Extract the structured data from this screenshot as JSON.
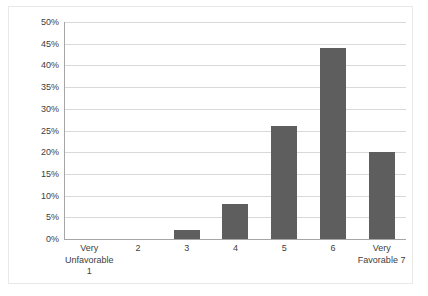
{
  "chart_data": {
    "type": "bar",
    "title": "",
    "xlabel": "",
    "ylabel": "",
    "categories": [
      "Very Unfavorable 1",
      "2",
      "3",
      "4",
      "5",
      "6",
      "Very Favorable 7"
    ],
    "category_label_lines": [
      [
        "Very",
        "Unfavorable",
        "1"
      ],
      [
        "2"
      ],
      [
        "3"
      ],
      [
        "4"
      ],
      [
        "5"
      ],
      [
        "6"
      ],
      [
        "Very",
        "Favorable 7"
      ]
    ],
    "values": [
      0,
      0,
      2,
      8,
      26,
      44,
      20
    ],
    "value_labels": [
      "0%",
      "0%",
      "2%",
      "8%",
      "26%",
      "44%",
      "20%"
    ],
    "ylim": [
      0,
      50
    ],
    "ytick_values": [
      0,
      5,
      10,
      15,
      20,
      25,
      30,
      35,
      40,
      45,
      50
    ],
    "ytick_labels": [
      "0%",
      "5%",
      "10%",
      "15%",
      "20%",
      "25%",
      "30%",
      "35%",
      "40%",
      "45%",
      "50%"
    ],
    "grid": "horizontal",
    "legend": "none",
    "bar_color": "#5e5e5e",
    "gridline_color": "#d9d9d9",
    "axis_color": "#a6a6a6",
    "plot_background": "#ffffff",
    "border_color": "#e8e8e8"
  }
}
